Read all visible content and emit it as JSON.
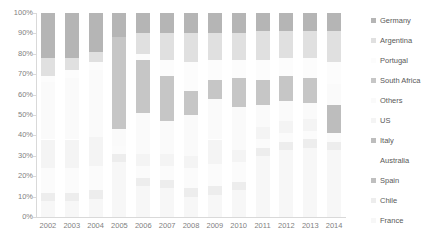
{
  "chart_data": {
    "type": "bar",
    "title": "",
    "xlabel": "",
    "ylabel": "",
    "stacked": true,
    "grid": false,
    "legend_position": "right",
    "ylim": [
      0,
      100
    ],
    "ytick_labels": [
      "100%",
      "90%",
      "80%",
      "70%",
      "60%",
      "50%",
      "40%",
      "30%",
      "20%",
      "10%",
      "0%"
    ],
    "ytick_values": [
      100,
      90,
      80,
      70,
      60,
      50,
      40,
      30,
      20,
      10,
      0
    ],
    "categories": [
      "2002",
      "2003",
      "2004",
      "2005",
      "2006",
      "2007",
      "2008",
      "2009",
      "2010",
      "2011",
      "2012",
      "2013",
      "2014"
    ],
    "series": [
      {
        "name": "France",
        "color": "#f7f7f7",
        "values": [
          8,
          8,
          9,
          27,
          15,
          14,
          10,
          11,
          13,
          30,
          33,
          34,
          33
        ]
      },
      {
        "name": "Chile",
        "color": "#ededed",
        "values": [
          4,
          4,
          4,
          4,
          4,
          4,
          4,
          4,
          4,
          4,
          4,
          4,
          4
        ]
      },
      {
        "name": "Spain",
        "color": "#bfbfbf",
        "values": [
          0,
          0,
          0,
          0,
          0,
          0,
          0,
          0,
          0,
          0,
          0,
          0,
          0
        ]
      },
      {
        "name": "Australia",
        "color": "#fbfbfb",
        "values": [
          12,
          12,
          12,
          4,
          6,
          7,
          10,
          11,
          10,
          4,
          4,
          4,
          4
        ]
      },
      {
        "name": "Italy",
        "color": "#bdbdbd",
        "values": [
          0,
          0,
          0,
          0,
          0,
          0,
          0,
          0,
          0,
          0,
          0,
          0,
          14
        ]
      },
      {
        "name": "US",
        "color": "#f4f4f4",
        "values": [
          14,
          14,
          14,
          0,
          6,
          6,
          6,
          12,
          6,
          6,
          6,
          6,
          0
        ]
      },
      {
        "name": "Others",
        "color": "#fafafa",
        "values": [
          28,
          30,
          33,
          8,
          20,
          16,
          20,
          20,
          21,
          11,
          10,
          8,
          10
        ]
      },
      {
        "name": "South Africa",
        "color": "#c6c6c6",
        "values": [
          0,
          0,
          0,
          45,
          26,
          22,
          12,
          9,
          14,
          12,
          12,
          12,
          0
        ]
      },
      {
        "name": "Portugal",
        "color": "#fcfcfc",
        "values": [
          3,
          4,
          4,
          0,
          3,
          8,
          14,
          10,
          9,
          10,
          9,
          10,
          11
        ]
      },
      {
        "name": "Argentina",
        "color": "#e0e0e0",
        "values": [
          9,
          6,
          5,
          0,
          10,
          13,
          14,
          13,
          13,
          14,
          13,
          13,
          15
        ]
      },
      {
        "name": "Germany",
        "color": "#b5b5b5",
        "values": [
          22,
          22,
          19,
          12,
          10,
          10,
          10,
          10,
          10,
          9,
          9,
          9,
          9
        ]
      }
    ],
    "stack_order_bottom_to_top": [
      "France",
      "Chile",
      "Spain",
      "Australia",
      "Italy",
      "US",
      "Others",
      "South Africa",
      "Portugal",
      "Argentina",
      "Germany"
    ],
    "legend_entries": [
      {
        "label": "Germany",
        "color": "#b5b5b5"
      },
      {
        "label": "Argentina",
        "color": "#e0e0e0"
      },
      {
        "label": "Portugal",
        "color": "#fcfcfc"
      },
      {
        "label": "South Africa",
        "color": "#c6c6c6"
      },
      {
        "label": "Others",
        "color": "#fafafa"
      },
      {
        "label": "US",
        "color": "#f4f4f4"
      },
      {
        "label": "Italy",
        "color": "#bdbdbd"
      },
      {
        "label": "Australia",
        "color": "#ffffff"
      },
      {
        "label": "Spain",
        "color": "#bfbfbf"
      },
      {
        "label": "Chile",
        "color": "#ededed"
      },
      {
        "label": "France",
        "color": "#f7f7f7"
      }
    ]
  }
}
